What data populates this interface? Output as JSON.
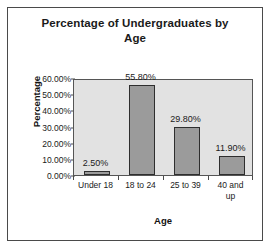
{
  "chart_data": {
    "type": "bar",
    "title": "Percentage of Undergraduates by Age",
    "title_line1": "Percentage of Undergraduates by",
    "title_line2": "Age",
    "xlabel": "Age",
    "ylabel": "Percentage",
    "categories": [
      "Under 18",
      "18 to 24",
      "25 to 39",
      "40 and up"
    ],
    "category_lines": [
      [
        "Under 18"
      ],
      [
        "18 to 24"
      ],
      [
        "25 to 39"
      ],
      [
        "40 and",
        "up"
      ]
    ],
    "values": [
      2.5,
      55.8,
      29.8,
      11.9
    ],
    "data_labels": [
      "2.50%",
      "55.80%",
      "29.80%",
      "11.90%"
    ],
    "ylim": [
      0,
      60
    ],
    "ytick_values": [
      0,
      10,
      20,
      30,
      40,
      50,
      60
    ],
    "ytick_labels": [
      "0.00%",
      "10.00%",
      "20.00%",
      "30.00%",
      "40.00%",
      "50.00%",
      "60.00%"
    ],
    "grid": false,
    "legend": false,
    "colors": {
      "bar_fill": "#9b9b9b",
      "bar_border": "#2e2e2e",
      "plot_background": "#e2e2e2",
      "frame_border": "#4a4a4a",
      "text": "#1a1a1a",
      "page_background": "#ffffff"
    }
  }
}
